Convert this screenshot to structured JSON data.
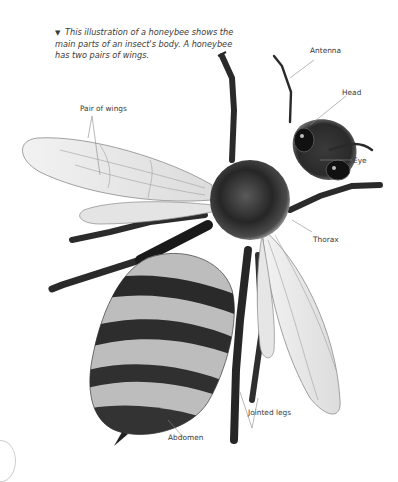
{
  "caption": {
    "marker": "▼",
    "text": "This illustration of a honeybee shows the main parts of an insect's body. A honeybee has two pairs of wings."
  },
  "labels": {
    "antenna": "Antenna",
    "head": "Head",
    "eye": "Eye",
    "pair_of_wings": "Pair of wings",
    "thorax": "Thorax",
    "jointed_legs": "Jointed legs",
    "abdomen": "Abdomen"
  },
  "colors": {
    "background": "#ffffff",
    "label_text": "#3a3a3a",
    "leader_line": "#8a8a8a",
    "body_dark": "#1e1e1e",
    "wing_fill": "#e9e9e9"
  }
}
